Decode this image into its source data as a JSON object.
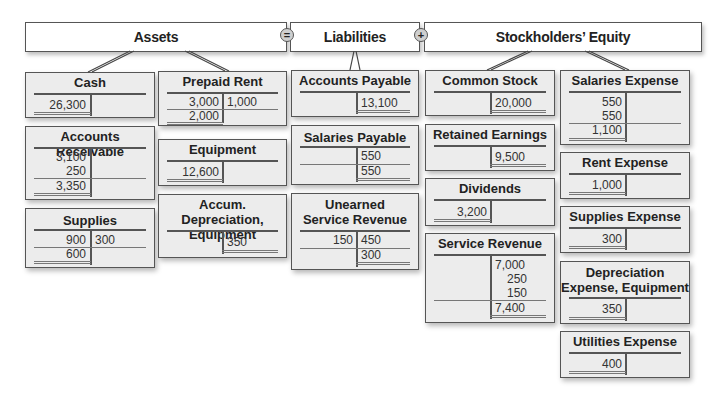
{
  "headers": {
    "assets": "Assets",
    "liabilities": "Liabilities",
    "equity": "Stockholders’ Equity",
    "equals_sign": "=",
    "plus_sign": "+"
  },
  "accounts": {
    "cash": {
      "title": "Cash",
      "debits": [
        "26,300"
      ],
      "credits": [],
      "balance": ""
    },
    "prepaid_rent": {
      "title": "Prepaid Rent",
      "debits": [
        "3,000"
      ],
      "credits": [
        "1,000"
      ],
      "balance": "2,000"
    },
    "accounts_receivable": {
      "title": "Accounts Receivable",
      "debits": [
        "3,100",
        "250"
      ],
      "credits": [],
      "balance": "3,350"
    },
    "equipment": {
      "title": "Equipment",
      "debits": [
        "12,600"
      ],
      "credits": [],
      "balance": ""
    },
    "supplies": {
      "title": "Supplies",
      "debits": [
        "900"
      ],
      "credits": [
        "300"
      ],
      "balance": "600"
    },
    "accum_depreciation": {
      "title_line1": "Accum. Depreciation,",
      "title_line2": "Equipment",
      "debits": [],
      "credits": [
        "350"
      ],
      "balance": ""
    },
    "accounts_payable": {
      "title": "Accounts Payable",
      "debits": [],
      "credits": [
        "13,100"
      ],
      "balance": ""
    },
    "salaries_payable": {
      "title": "Salaries Payable",
      "debits": [],
      "credits": [
        "550"
      ],
      "balance": "550"
    },
    "unearned_service_revenue": {
      "title_line1": "Unearned",
      "title_line2": "Service Revenue",
      "debits": [
        "150"
      ],
      "credits": [
        "450"
      ],
      "balance": "300"
    },
    "common_stock": {
      "title": "Common Stock",
      "debits": [],
      "credits": [
        "20,000"
      ],
      "balance": ""
    },
    "retained_earnings": {
      "title": "Retained Earnings",
      "debits": [],
      "credits": [
        "9,500"
      ],
      "balance": ""
    },
    "dividends": {
      "title": "Dividends",
      "debits": [
        "3,200"
      ],
      "credits": [],
      "balance": ""
    },
    "service_revenue": {
      "title": "Service Revenue",
      "debits": [],
      "credits": [
        "7,000",
        "250",
        "150"
      ],
      "balance": "7,400"
    },
    "salaries_expense": {
      "title": "Salaries Expense",
      "debits": [
        "550",
        "550"
      ],
      "credits": [],
      "balance": "1,100"
    },
    "rent_expense": {
      "title": "Rent Expense",
      "debits": [
        "1,000"
      ],
      "credits": [],
      "balance": ""
    },
    "supplies_expense": {
      "title": "Supplies Expense",
      "debits": [
        "300"
      ],
      "credits": [],
      "balance": ""
    },
    "depreciation_expense": {
      "title_line1": "Depreciation",
      "title_line2": "Expense, Equipment",
      "debits": [
        "350"
      ],
      "credits": [],
      "balance": ""
    },
    "utilities_expense": {
      "title": "Utilities Expense",
      "debits": [
        "400"
      ],
      "credits": [],
      "balance": ""
    }
  }
}
